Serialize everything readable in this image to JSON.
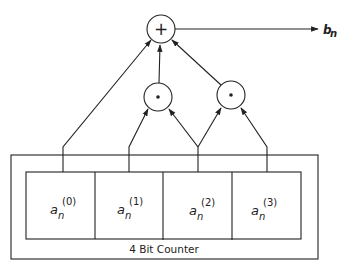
{
  "diagram": {
    "title": "4 Bit Counter",
    "output_label": {
      "base": "b",
      "sub": "n"
    },
    "adder_symbol": "+",
    "and_symbol": "•",
    "cells": [
      {
        "base": "a",
        "sub": "n",
        "sup": "(0)"
      },
      {
        "base": "a",
        "sub": "n",
        "sup": "(1)"
      },
      {
        "base": "a",
        "sub": "n",
        "sup": "(2)"
      },
      {
        "base": "a",
        "sub": "n",
        "sup": "(3)"
      }
    ],
    "nodes": [
      {
        "id": "adder",
        "type": "sum",
        "symbol": "+"
      },
      {
        "id": "and1",
        "type": "product",
        "symbol": "•",
        "inputs": [
          "a_n^(1)",
          "a_n^(2)"
        ]
      },
      {
        "id": "and2",
        "type": "product",
        "symbol": "•",
        "inputs": [
          "a_n^(2)",
          "a_n^(3)"
        ]
      }
    ],
    "edges": [
      {
        "from": "a_n^(0)",
        "to": "adder"
      },
      {
        "from": "and1",
        "to": "adder"
      },
      {
        "from": "and2",
        "to": "adder"
      },
      {
        "from": "adder",
        "to": "b_n"
      }
    ]
  }
}
